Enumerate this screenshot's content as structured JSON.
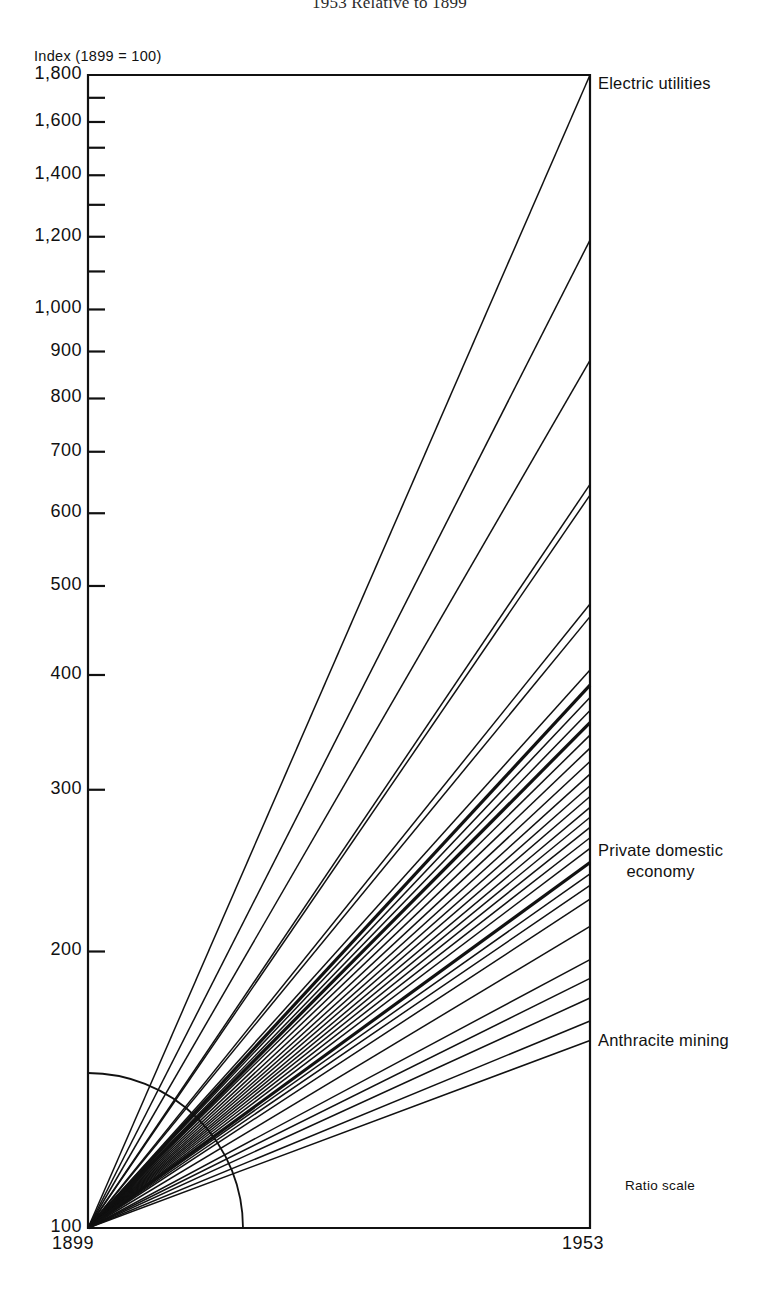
{
  "title": "1953 Relative to 1899",
  "axis": {
    "index_caption": "Index (1899 = 100)",
    "x_start_label": "1899",
    "x_end_label": "1953",
    "ratio_note": "Ratio scale"
  },
  "annotations": {
    "top_series": "Electric utilities",
    "mid_series_line1": "Private domestic",
    "mid_series_line2": "economy",
    "bottom_series": "Anthracite mining"
  },
  "chart_data": {
    "type": "line",
    "title": "1953 Relative to 1899",
    "subtitle": "",
    "xlabel": "",
    "ylabel": "Index (1899 = 100)",
    "scale": "log",
    "grid": false,
    "legend_position": "right-inline",
    "x": [
      1899,
      1953
    ],
    "xlim": [
      1899,
      1953
    ],
    "ylim": [
      100,
      1800
    ],
    "ytick_labels": [
      "1,800",
      "1,600",
      "1,400",
      "1,200",
      "1,000",
      "900",
      "800",
      "700",
      "600",
      "500",
      "400",
      "300",
      "200",
      "100"
    ],
    "yticks": [
      1800,
      1600,
      1400,
      1200,
      1000,
      900,
      800,
      700,
      600,
      500,
      400,
      300,
      200,
      100
    ],
    "yticks_minor": [
      1700,
      1500,
      1300,
      1100
    ],
    "xtick_labels": [
      "1899",
      "1953"
    ],
    "note": "All series start at index 100 in 1899; each straight ray ends at its 1953 index value.",
    "series": [
      {
        "name": "Electric utilities",
        "values": [
          100,
          1800
        ],
        "labeled": true,
        "weight": "normal"
      },
      {
        "name": "Series 2",
        "values": [
          100,
          1190
        ],
        "labeled": false,
        "weight": "normal"
      },
      {
        "name": "Series 3",
        "values": [
          100,
          880
        ],
        "labeled": false,
        "weight": "normal"
      },
      {
        "name": "Series 4",
        "values": [
          100,
          645
        ],
        "labeled": false,
        "weight": "normal"
      },
      {
        "name": "Series 5",
        "values": [
          100,
          628
        ],
        "labeled": false,
        "weight": "normal"
      },
      {
        "name": "Series 6",
        "values": [
          100,
          478
        ],
        "labeled": false,
        "weight": "normal"
      },
      {
        "name": "Series 7",
        "values": [
          100,
          463
        ],
        "labeled": false,
        "weight": "normal"
      },
      {
        "name": "Series 8",
        "values": [
          100,
          405
        ],
        "labeled": false,
        "weight": "normal"
      },
      {
        "name": "Series 9",
        "values": [
          100,
          390
        ],
        "labeled": false,
        "weight": "bold"
      },
      {
        "name": "Series 10",
        "values": [
          100,
          378
        ],
        "labeled": false,
        "weight": "normal"
      },
      {
        "name": "Series 11",
        "values": [
          100,
          366
        ],
        "labeled": false,
        "weight": "normal"
      },
      {
        "name": "Series 12",
        "values": [
          100,
          355
        ],
        "labeled": false,
        "weight": "bold"
      },
      {
        "name": "Series 13",
        "values": [
          100,
          344
        ],
        "labeled": false,
        "weight": "normal"
      },
      {
        "name": "Series 14",
        "values": [
          100,
          333
        ],
        "labeled": false,
        "weight": "normal"
      },
      {
        "name": "Series 15",
        "values": [
          100,
          322
        ],
        "labeled": false,
        "weight": "normal"
      },
      {
        "name": "Series 16",
        "values": [
          100,
          312
        ],
        "labeled": false,
        "weight": "normal"
      },
      {
        "name": "Series 17",
        "values": [
          100,
          303
        ],
        "labeled": false,
        "weight": "normal"
      },
      {
        "name": "Series 18",
        "values": [
          100,
          295
        ],
        "labeled": false,
        "weight": "normal"
      },
      {
        "name": "Series 19",
        "values": [
          100,
          287
        ],
        "labeled": false,
        "weight": "normal"
      },
      {
        "name": "Series 20",
        "values": [
          100,
          280
        ],
        "labeled": false,
        "weight": "normal"
      },
      {
        "name": "Series 21",
        "values": [
          100,
          273
        ],
        "labeled": false,
        "weight": "normal"
      },
      {
        "name": "Series 22",
        "values": [
          100,
          266
        ],
        "labeled": false,
        "weight": "normal"
      },
      {
        "name": "Series 23",
        "values": [
          100,
          259
        ],
        "labeled": false,
        "weight": "normal"
      },
      {
        "name": "Private domestic economy",
        "values": [
          100,
          250
        ],
        "labeled": true,
        "weight": "bold"
      },
      {
        "name": "Series 25",
        "values": [
          100,
          243
        ],
        "labeled": false,
        "weight": "normal"
      },
      {
        "name": "Series 26",
        "values": [
          100,
          236
        ],
        "labeled": false,
        "weight": "normal"
      },
      {
        "name": "Series 27",
        "values": [
          100,
          228
        ],
        "labeled": false,
        "weight": "normal"
      },
      {
        "name": "Series 28",
        "values": [
          100,
          213
        ],
        "labeled": false,
        "weight": "normal"
      },
      {
        "name": "Series 29",
        "values": [
          100,
          196
        ],
        "labeled": false,
        "weight": "normal"
      },
      {
        "name": "Series 30",
        "values": [
          100,
          187
        ],
        "labeled": false,
        "weight": "normal"
      },
      {
        "name": "Series 31",
        "values": [
          100,
          178
        ],
        "labeled": false,
        "weight": "normal"
      },
      {
        "name": "Series 32",
        "values": [
          100,
          168
        ],
        "labeled": false,
        "weight": "normal"
      },
      {
        "name": "Anthracite mining",
        "values": [
          100,
          160
        ],
        "labeled": true,
        "weight": "normal"
      }
    ]
  }
}
